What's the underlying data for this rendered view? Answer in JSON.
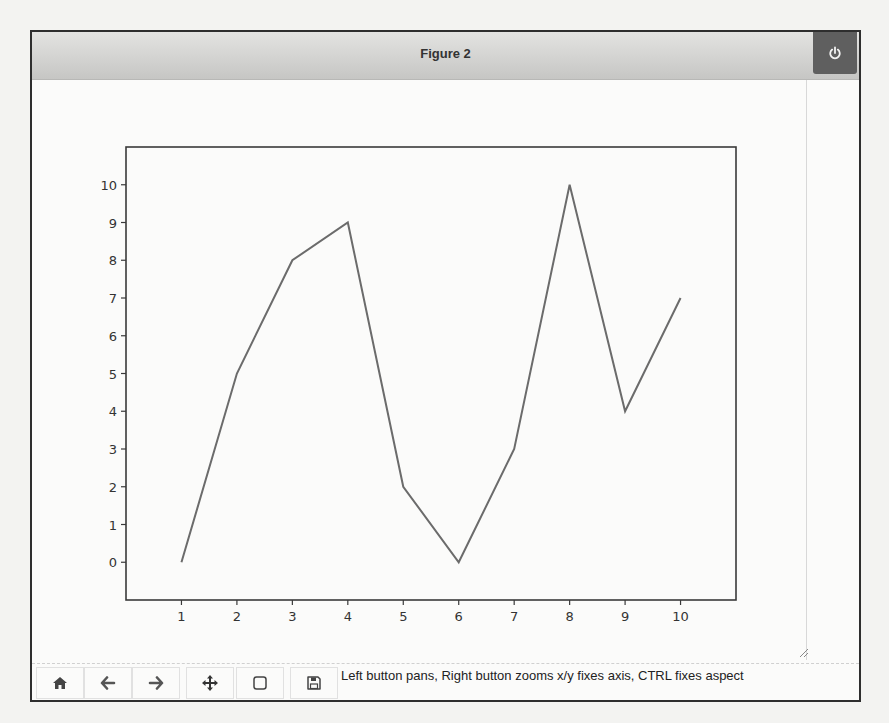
{
  "window": {
    "title": "Figure 2",
    "close_icon": "power-icon"
  },
  "background_text": [
    "All you really need to do to add a grid to your plot is call the grid",
    "with many other MatPlotLib functions, you can add parameters to",
    "precisely as you want to see it. For example, you can choose wheth",
    "grid lines, y grid lines, or both. The output from this examp",
    "Figure 2. In this case, the figure shows the grid as a background w",
    "function."
  ],
  "toolbar": {
    "buttons": [
      {
        "name": "home",
        "icon": "home-icon"
      },
      {
        "name": "back",
        "icon": "arrow-left-icon"
      },
      {
        "name": "forward",
        "icon": "arrow-right-icon"
      },
      {
        "name": "pan",
        "icon": "move-icon"
      },
      {
        "name": "zoom",
        "icon": "zoom-rect-icon"
      },
      {
        "name": "save",
        "icon": "save-icon"
      }
    ],
    "message": "Left button pans, Right button zooms x/y fixes axis, CTRL fixes aspect"
  },
  "chart_data": {
    "type": "line",
    "title": "",
    "xlabel": "",
    "ylabel": "",
    "x": [
      1,
      2,
      3,
      4,
      5,
      6,
      7,
      8,
      9,
      10
    ],
    "series": [
      {
        "name": "",
        "values": [
          0,
          5,
          8,
          9,
          2,
          0,
          3,
          10,
          4,
          7
        ],
        "color": "#6b6b6b"
      }
    ],
    "xticks": [
      "1",
      "2",
      "3",
      "4",
      "5",
      "6",
      "7",
      "8",
      "9",
      "10"
    ],
    "yticks": [
      "0",
      "1",
      "2",
      "3",
      "4",
      "5",
      "6",
      "7",
      "8",
      "9",
      "10"
    ],
    "xlim": [
      0.0,
      11.0
    ],
    "ylim": [
      -1.0,
      11.0
    ],
    "grid": false,
    "legend": false
  }
}
